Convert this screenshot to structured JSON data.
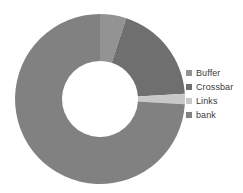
{
  "chart_data": {
    "type": "pie",
    "variant": "donut",
    "title": "",
    "xlabel": "",
    "ylabel": "",
    "grid": false,
    "legend_position": "right",
    "start_angle_deg": 0,
    "direction": "clockwise",
    "center": {
      "x": 100,
      "y": 99
    },
    "outer_radius": 85,
    "inner_radius": 38,
    "categories": [
      "Buffer",
      "Crossbar",
      "Links",
      "bank"
    ],
    "values": [
      5,
      19,
      2,
      74
    ],
    "unit": "%",
    "colors": [
      "#939393",
      "#6f6f6f",
      "#c8c8c8",
      "#818181"
    ],
    "slices": [
      {
        "label": "Buffer",
        "value": 5,
        "color": "#939393",
        "start_deg": 0,
        "end_deg": 18
      },
      {
        "label": "Crossbar",
        "value": 19,
        "color": "#6f6f6f",
        "start_deg": 18,
        "end_deg": 86.4
      },
      {
        "label": "Links",
        "value": 2,
        "color": "#c8c8c8",
        "start_deg": 86.4,
        "end_deg": 93.6
      },
      {
        "label": "bank",
        "value": 74,
        "color": "#818181",
        "start_deg": 93.6,
        "end_deg": 360
      }
    ]
  },
  "legend": {
    "items": [
      {
        "label": "Buffer",
        "color": "#939393"
      },
      {
        "label": "Crossbar",
        "color": "#6f6f6f"
      },
      {
        "label": "Links",
        "color": "#c8c8c8"
      },
      {
        "label": "bank",
        "color": "#818181"
      }
    ]
  }
}
